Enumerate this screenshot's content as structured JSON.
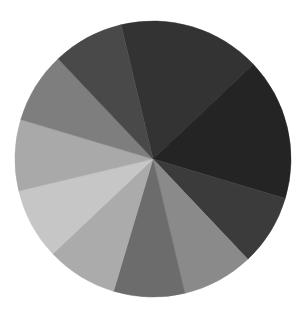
{
  "chart_data": {
    "type": "pie",
    "title": "",
    "legend": [],
    "start_angle_deg_clockwise_from_top": 346.6,
    "center": [
      153,
      159
    ],
    "radius": 138,
    "labels": [
      "",
      "",
      "",
      "",
      "",
      "",
      "",
      "",
      "",
      ""
    ],
    "values": [
      2,
      2,
      1,
      1,
      1,
      1,
      1,
      1,
      1,
      1
    ],
    "colors": [
      "#333333",
      "#242424",
      "#3b3b3b",
      "#8a8a8a",
      "#6c6c6c",
      "#ababab",
      "#c6c6c6",
      "#a9a9a9",
      "#7e7e7e",
      "#494949"
    ]
  }
}
